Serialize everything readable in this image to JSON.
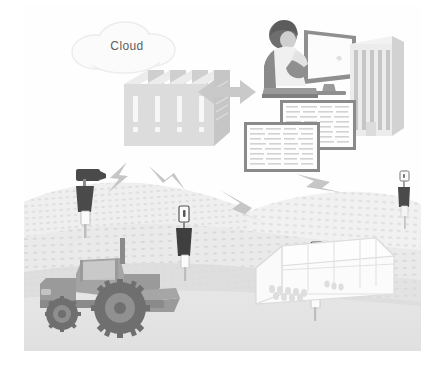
{
  "figure": {
    "type": "illustration",
    "background_color": "#ffffff",
    "canvas_color": "#fefefe"
  },
  "labels": {
    "cloud": "Cloud"
  },
  "palette": {
    "cloud_fill": "#fbfbfb",
    "cloud_stroke": "#ededed",
    "server_light": "#e2e2e2",
    "server_mid": "#cfcfcf",
    "server_dark": "#bdbdbd",
    "server_top": "#eaeaea",
    "arrow": "#c9c9c9",
    "person_hair": "#6e6e6e",
    "person_body": "#8f8f8f",
    "person_shirt": "#e8e8e8",
    "monitor_frame": "#8f8f8f",
    "monitor_screen": "#fcfcfc",
    "building_face": "#e8e8e8",
    "building_side": "#d4d4d4",
    "building_stripe": "#c6c6c6",
    "table_border": "#8a8a8a",
    "table_fill": "#fdfdfd",
    "table_row": "#cfcfcf",
    "bolt": "#c4c4c4",
    "field_far": "#f0f0f0",
    "field_mid": "#e8e8e8",
    "field_near": "#e1e1e1",
    "ground": "#e4e4e4",
    "crop_dot": "#d6d6d6",
    "sensor_dark": "#4a4a4a",
    "sensor_box": "#fbfbfb",
    "sensor_stroke": "#6d6d6d",
    "pole": "#bdbdbd",
    "tractor_body": "#9a9a9a",
    "tractor_dark": "#8a8a8a",
    "tractor_cab": "#b4b4b4",
    "tractor_glass": "#c9c9c9",
    "tire": "#6f6f6f",
    "greenhouse_fill": "#fbfbfb",
    "greenhouse_stroke": "#d8d8d8"
  },
  "elements": {
    "cloud": {
      "name": "cloud",
      "count": 1
    },
    "servers": {
      "name": "server-stack",
      "count": 4
    },
    "exchange_arrow": {
      "name": "bidirectional-arrow",
      "direction": "left-right"
    },
    "workstation": {
      "name": "person-at-computer",
      "count": 1
    },
    "office_building": {
      "name": "office-building",
      "count": 1
    },
    "data_tables": {
      "name": "data-table-window",
      "count": 2
    },
    "signal_bolts": {
      "name": "lightning-bolt",
      "count": 4
    },
    "field_sensors": {
      "name": "field-sensor-pole",
      "count": 4
    },
    "camera_sensor": {
      "name": "camera-sensor-pole",
      "count": 1
    },
    "tractor": {
      "name": "tractor",
      "count": 1
    },
    "greenhouse": {
      "name": "greenhouse",
      "count": 1
    }
  }
}
